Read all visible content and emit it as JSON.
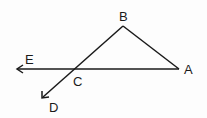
{
  "diagram": {
    "type": "geometry",
    "points": {
      "A": {
        "label": "A",
        "x": 179,
        "y": 69
      },
      "B": {
        "label": "B",
        "x": 123,
        "y": 26
      },
      "C": {
        "label": "C",
        "x": 73,
        "y": 69
      },
      "D": {
        "label": "D",
        "x": 42,
        "y": 98
      },
      "E": {
        "label": "E",
        "x": 17,
        "y": 69
      }
    },
    "labels": {
      "A": "A",
      "B": "B",
      "C": "C",
      "D": "D",
      "E": "E"
    },
    "segments": [
      {
        "from": "B",
        "to": "A"
      },
      {
        "from": "A",
        "to": "E",
        "arrow_at": "E"
      },
      {
        "from": "B",
        "to": "D",
        "arrow_at": "D",
        "through": "C"
      }
    ],
    "stroke_color": "#1a1a1a"
  }
}
